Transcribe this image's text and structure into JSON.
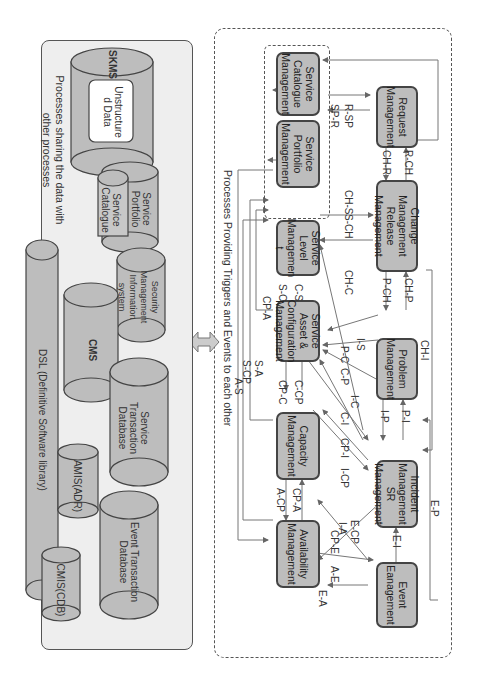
{
  "top_panel": {
    "caption": "Processes Providing Triggers and Events to each other",
    "processes": [
      {
        "id": "event",
        "label": "Event Eanagement"
      },
      {
        "id": "incident",
        "label": "Incident Management SR Management"
      },
      {
        "id": "problem",
        "label": "Problem Management"
      },
      {
        "id": "change",
        "label": "Change Management Release Management"
      },
      {
        "id": "request",
        "label": "Request Management"
      },
      {
        "id": "availability",
        "label": "Availability Management"
      },
      {
        "id": "capacity",
        "label": "Capacity Management"
      },
      {
        "id": "sacm",
        "label": "Service Asset & Configuration Management"
      },
      {
        "id": "slm",
        "label": "Service Level Managemen t"
      },
      {
        "id": "portfolio",
        "label": "Service Portfolio Management"
      },
      {
        "id": "catalogue",
        "label": "Service Catalogue Management"
      }
    ],
    "flows": {
      "e_i": "E-I",
      "e_p": "E-P",
      "e_a": "E-A",
      "a_e": "A-E",
      "e_cp": "E-CP",
      "cp_e": "CP-E",
      "i_a": "I-A",
      "p_i": "P-I",
      "i_p": "I-P",
      "ch_i": "CH-I",
      "ch_p": "CH-P",
      "p_ch": "P-CH",
      "r_ch": "R-CH",
      "ch_r": "CH-R",
      "r_sp": "R-SP",
      "sp_r": "SP-R",
      "s_ch": "S-CH",
      "ch_s": "CH-S",
      "ch_c": "CH-C",
      "i_s": "I-S",
      "p_c": "P-C",
      "c_p": "C-P",
      "i_c": "I-C",
      "c_i": "C-I",
      "cp_i": "CP-I",
      "i_cp": "I-CP",
      "c_cp": "C-CP",
      "cp_c": "CP-C",
      "cp_a": "CP-A",
      "a_cp": "A-CP",
      "c_s": "C-S",
      "s_c": "S-C",
      "cp_a2": "CP-A",
      "s_a": "S-A",
      "s_cp": "S-CP",
      "a_s": "A-S"
    }
  },
  "bottom_panel": {
    "caption_line1": "Processes sharing the data with",
    "caption_line2": "other processes",
    "stores": {
      "skms": "SKMS",
      "unstructured": "Unstructure d Data",
      "portfolio": "Service Portfolio",
      "catalogue": "Service Catalogue",
      "smis": "Security Management Information system",
      "cms": "CMS",
      "dsl": "DSL (Definitive Software library)",
      "stdb": "Service Transaction Database",
      "amis": "AMIS(ADR)",
      "etdb": "Event Transaction Database",
      "cmis": "CMIS(CDB)"
    }
  },
  "colors": {
    "box_fill": "#bdbdbd",
    "border": "#444444",
    "panel_fill": "#eeeeee",
    "arrow": "#cccccc"
  }
}
